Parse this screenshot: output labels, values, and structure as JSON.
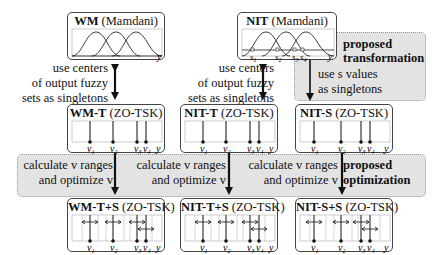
{
  "diagram": {
    "top_row": [
      {
        "id": "wm",
        "name": "WM",
        "type": "(Mamdani)",
        "axis": "y"
      },
      {
        "id": "nit",
        "name": "NIT",
        "type": "(Mamdani)",
        "axis": "y",
        "s_labels": [
          "s1",
          "s2",
          "s3",
          "s4"
        ]
      }
    ],
    "middle_row": [
      {
        "id": "wm-t",
        "name": "WM-T",
        "type": "(ZO-TSK)",
        "axis": "y"
      },
      {
        "id": "nit-t",
        "name": "NIT-T",
        "type": "(ZO-TSK)",
        "axis": "y"
      },
      {
        "id": "nit-s",
        "name": "NIT-S",
        "type": "(ZO-TSK)",
        "axis": "y"
      }
    ],
    "bottom_row": [
      {
        "id": "wm-t-s",
        "name": "WM-T+S",
        "type": "(ZO-TSK)",
        "axis": "y"
      },
      {
        "id": "nit-t-s",
        "name": "NIT-T+S",
        "type": "(ZO-TSK)",
        "axis": "y"
      },
      {
        "id": "nit-s-s",
        "name": "NIT-S+S",
        "type": "(ZO-TSK)",
        "axis": "y"
      }
    ],
    "v_labels": [
      "v1",
      "v2",
      "v3",
      "v4"
    ],
    "annotations": {
      "centers_left": [
        "use centers",
        "of output fuzzy",
        "sets as singletons"
      ],
      "centers_mid": [
        "use centers",
        "of output fuzzy",
        "sets as singletons"
      ],
      "s_values": [
        "use s values",
        "as singletons"
      ],
      "proposed_transformation": [
        "proposed",
        "transformation"
      ],
      "calc_1": [
        "calculate v ranges",
        "and optimize v"
      ],
      "calc_2": [
        "calculate v ranges",
        "and optimize v"
      ],
      "calc_3": [
        "calculate v ranges",
        "and optimize v"
      ],
      "proposed_optimization": [
        "proposed",
        "optimization"
      ]
    }
  }
}
